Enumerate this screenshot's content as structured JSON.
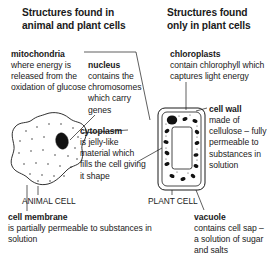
{
  "diagram": {
    "ink_color": "#1a1a1a",
    "background": "#ffffff"
  },
  "headings": {
    "left": "Structures found in animal and plant cells",
    "right": "Structures found only in plant cells"
  },
  "labels": {
    "mitochondria": {
      "term": "mitochondria",
      "description": "where energy is released from the oxidation of glucose"
    },
    "nucleus": {
      "term": "nucleus",
      "description": "contains the chromosomes which carry genes"
    },
    "cytoplasm": {
      "term": "cytoplasm",
      "description": "is jelly-like material which fills the cell giving it shape"
    },
    "cell_membrane": {
      "term": "cell membrane",
      "description": "is partially permeable to substances in solution"
    },
    "chloroplasts": {
      "term": "chloroplasts",
      "description": "contain chlorophyll which captures light energy"
    },
    "cell_wall": {
      "term": "cell wall",
      "description": "made of cellulose – fully permeable to substances in solution"
    },
    "vacuole": {
      "term": "vacuole",
      "description": "contains cell sap – a solution of sugar and salts"
    }
  },
  "cells": {
    "animal": {
      "caption": "ANIMAL CELL"
    },
    "plant": {
      "caption": "PLANT CELL"
    }
  }
}
